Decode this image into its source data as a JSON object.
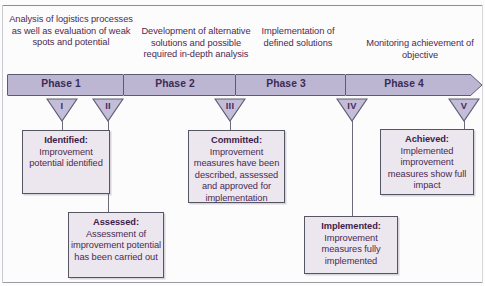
{
  "diagram": {
    "colors": {
      "chevron_fill": "#bcb6d3",
      "chevron_border": "#5d5a74",
      "triangle_fill": "#c3bdd8",
      "triangle_border": "#5d5a74",
      "box_fill": "#ece6ee",
      "box_border": "#555563",
      "text": "#4b2a52"
    },
    "phase_descriptions": [
      {
        "id": "desc-phase-1",
        "text": "Analysis of logistics processes as well as evaluation of weak spots and potential"
      },
      {
        "id": "desc-phase-2",
        "text": "Development of alternative solutions and possible required in-depth analysis"
      },
      {
        "id": "desc-phase-3",
        "text": "Implementation of defined solutions"
      },
      {
        "id": "desc-phase-4",
        "text": "Monitoring achievement of objective"
      }
    ],
    "phases": [
      {
        "id": "phase-1",
        "label": "Phase 1"
      },
      {
        "id": "phase-2",
        "label": "Phase 2"
      },
      {
        "id": "phase-3",
        "label": "Phase 3"
      },
      {
        "id": "phase-4",
        "label": "Phase 4"
      }
    ],
    "milestones": [
      {
        "id": "milestone-1",
        "numeral": "I"
      },
      {
        "id": "milestone-2",
        "numeral": "II"
      },
      {
        "id": "milestone-3",
        "numeral": "III"
      },
      {
        "id": "milestone-4",
        "numeral": "IV"
      },
      {
        "id": "milestone-5",
        "numeral": "V"
      }
    ],
    "boxes": [
      {
        "id": "box-identified",
        "title": "Identified:",
        "body": "Improvement potential identified"
      },
      {
        "id": "box-assessed",
        "title": "Assessed:",
        "body": "Assessment of improvement potential has been carried out"
      },
      {
        "id": "box-committed",
        "title": "Committed:",
        "body": "Improvement measures have been described, assessed and approved for implementation"
      },
      {
        "id": "box-implemented",
        "title": "Implemented:",
        "body": "Improvement measures fully implemented"
      },
      {
        "id": "box-achieved",
        "title": "Achieved:",
        "body": "Implemented improvement measures show full impact"
      }
    ]
  }
}
